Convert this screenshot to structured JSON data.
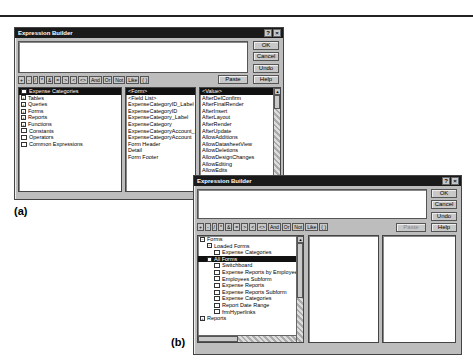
{
  "window_a": {
    "title": "Expression Builder",
    "help_btn": "?",
    "close_btn": "×",
    "buttons": {
      "ok": "OK",
      "cancel": "Cancel",
      "undo": "Undo",
      "paste": "Paste",
      "help": "Help"
    },
    "operators": [
      "+",
      "-",
      "/",
      "*",
      "&",
      "=",
      ">",
      "<",
      "<>",
      "And",
      "Or",
      "Not",
      "Like",
      "( )"
    ],
    "left_list": [
      {
        "label": "Expense Categories",
        "icon": "folder-open-icon",
        "selected": true
      },
      {
        "label": "Tables",
        "icon": "plus-box-icon"
      },
      {
        "label": "Queries",
        "icon": "plus-box-icon"
      },
      {
        "label": "Forms",
        "icon": "plus-box-icon"
      },
      {
        "label": "Reports",
        "icon": "plus-box-icon"
      },
      {
        "label": "Functions",
        "icon": "plus-box-icon"
      },
      {
        "label": "Constants",
        "icon": "folder-icon"
      },
      {
        "label": "Operators",
        "icon": "folder-icon"
      },
      {
        "label": "Common Expressions",
        "icon": "folder-icon"
      }
    ],
    "middle_list": [
      "<Form>",
      "<Field List>",
      "ExpenseCategoryID_Label",
      "ExpenseCategoryID",
      "ExpenseCategory_Label",
      "ExpenseCategory",
      "ExpenseCategoryAccount_Label",
      "ExpenseCategoryAccount",
      "Form Header",
      "Detail",
      "Form Footer"
    ],
    "right_list": [
      "<Value>",
      "AfterDelConfirm",
      "AfterFinalRender",
      "AfterInsert",
      "AfterLayout",
      "AfterRender",
      "AfterUpdate",
      "AllowAdditions",
      "AllowDatasheetView",
      "AllowDeletions",
      "AllowDesignChanges",
      "AllowEditing",
      "AllowEdits",
      "AllowFilters",
      "AllowFormView",
      "AllowPivotChartView"
    ]
  },
  "window_b": {
    "title": "Expression Builder",
    "help_btn": "?",
    "close_btn": "×",
    "buttons": {
      "ok": "OK",
      "cancel": "Cancel",
      "undo": "Undo",
      "paste": "Paste",
      "help": "Help"
    },
    "operators": [
      "+",
      "-",
      "/",
      "*",
      "&",
      "=",
      ">",
      "<",
      "<>",
      "And",
      "Or",
      "Not",
      "Like",
      "( )"
    ],
    "tree": [
      {
        "label": "Forms",
        "indent": 0,
        "icon": "minus-box-icon"
      },
      {
        "label": "Loaded Forms",
        "indent": 1,
        "icon": "minus-box-icon"
      },
      {
        "label": "Expense Categories",
        "indent": 2,
        "icon": "folder-icon"
      },
      {
        "label": "All Forms",
        "indent": 1,
        "icon": "minus-box-icon",
        "selected": true
      },
      {
        "label": "Switchboard",
        "indent": 2,
        "icon": "folder-icon"
      },
      {
        "label": "Expense Reports by Employee",
        "indent": 2,
        "icon": "folder-icon"
      },
      {
        "label": "Employees Subform",
        "indent": 2,
        "icon": "folder-icon"
      },
      {
        "label": "Expense Reports",
        "indent": 2,
        "icon": "folder-icon"
      },
      {
        "label": "Expense Reports Subform",
        "indent": 2,
        "icon": "folder-icon"
      },
      {
        "label": "Expense Categories",
        "indent": 2,
        "icon": "folder-icon"
      },
      {
        "label": "Report Date Range",
        "indent": 2,
        "icon": "folder-icon"
      },
      {
        "label": "frmHyperlinks",
        "indent": 2,
        "icon": "folder-icon"
      },
      {
        "label": "Reports",
        "indent": 0,
        "icon": "plus-box-icon"
      }
    ]
  },
  "captions": {
    "a": "(a)",
    "b": "(b)"
  }
}
